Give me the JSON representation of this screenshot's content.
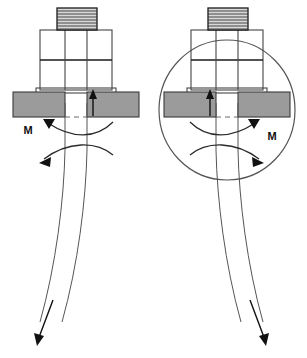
{
  "figure": {
    "background_color": "#ffffff",
    "width": 307,
    "height": 358,
    "line_color": "#444444",
    "plate_fill_color": "#9b9b9b",
    "thread_fill_color": "#d9d9d9",
    "arrow_color": "#111111"
  },
  "panels": [
    {
      "id": "left",
      "name": "left-assembly",
      "moment_label": "M",
      "moment_label_x": 28,
      "moment_label_y": 134,
      "moment_direction": "counterclockwise",
      "shaft_bend_direction": "left",
      "preload_arrow_side": "right",
      "has_highlight_circle": false
    },
    {
      "id": "right",
      "name": "right-assembly",
      "moment_label": "M",
      "moment_label_x": 272,
      "moment_label_y": 140,
      "moment_direction": "clockwise",
      "shaft_bend_direction": "right",
      "preload_arrow_side": "left",
      "has_highlight_circle": true,
      "highlight_circle": {
        "cx": 227,
        "cy": 110,
        "rx": 68,
        "ry": 70
      }
    }
  ],
  "components": {
    "thread_label": "threaded-stud",
    "nut_label": "nut-body",
    "plate_label": "clamped-plate",
    "shaft_label": "flexible-shaft",
    "moment_arc_label": "moment-arc",
    "preload_arrow_label": "preload-arrow",
    "tip_arrow_label": "shaft-tip-arrow",
    "thread_line_count": 7
  }
}
